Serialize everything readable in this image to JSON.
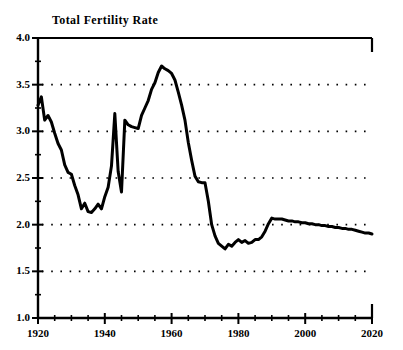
{
  "chart_data": {
    "type": "line",
    "title": "Total Fertility Rate",
    "xlabel": "",
    "ylabel": "",
    "xlim": [
      1920,
      2020
    ],
    "ylim": [
      1.0,
      4.0
    ],
    "grid": "horizontal-dotted",
    "legend": "none",
    "y_ticks": [
      "1.0",
      "1.5",
      "2.0",
      "2.5",
      "3.0",
      "3.5",
      "4.0"
    ],
    "y_tick_values": [
      1.0,
      1.5,
      2.0,
      2.5,
      3.0,
      3.5,
      4.0
    ],
    "y_minor_step": 0.25,
    "x_ticks": [
      "1920",
      "1940",
      "1960",
      "1980",
      "2000",
      "2020"
    ],
    "x_tick_values": [
      1920,
      1940,
      1960,
      1980,
      2000,
      2020
    ],
    "x_minor_step": 5,
    "line_color": "#000000",
    "line_width": 3,
    "series": [
      {
        "name": "Total Fertility Rate",
        "x": [
          1920,
          1921,
          1922,
          1923,
          1924,
          1925,
          1926,
          1927,
          1928,
          1929,
          1930,
          1931,
          1932,
          1933,
          1934,
          1935,
          1936,
          1937,
          1938,
          1939,
          1940,
          1941,
          1942,
          1943,
          1944,
          1945,
          1946,
          1947,
          1948,
          1949,
          1950,
          1951,
          1952,
          1953,
          1954,
          1955,
          1956,
          1957,
          1958,
          1959,
          1960,
          1961,
          1962,
          1963,
          1964,
          1965,
          1966,
          1967,
          1968,
          1969,
          1970,
          1971,
          1972,
          1973,
          1974,
          1975,
          1976,
          1977,
          1978,
          1979,
          1980,
          1981,
          1982,
          1983,
          1984,
          1985,
          1986,
          1987,
          1988,
          1989,
          1990,
          1991,
          1992,
          1993,
          1994,
          1995,
          1996,
          1997,
          1998,
          1999,
          2000,
          2001,
          2002,
          2003,
          2004,
          2005,
          2006,
          2007,
          2008,
          2009,
          2010,
          2011,
          2012,
          2013,
          2014,
          2015,
          2016,
          2017,
          2018,
          2019,
          2020
        ],
        "values": [
          3.28,
          3.37,
          3.12,
          3.17,
          3.1,
          2.98,
          2.87,
          2.8,
          2.64,
          2.56,
          2.54,
          2.42,
          2.32,
          2.17,
          2.23,
          2.14,
          2.13,
          2.17,
          2.22,
          2.17,
          2.3,
          2.4,
          2.63,
          3.19,
          2.57,
          2.35,
          3.12,
          3.07,
          3.05,
          3.04,
          3.03,
          3.17,
          3.25,
          3.33,
          3.45,
          3.52,
          3.63,
          3.7,
          3.67,
          3.65,
          3.62,
          3.55,
          3.42,
          3.28,
          3.12,
          2.88,
          2.69,
          2.52,
          2.46,
          2.45,
          2.45,
          2.25,
          2.0,
          1.88,
          1.8,
          1.77,
          1.74,
          1.79,
          1.77,
          1.81,
          1.84,
          1.81,
          1.83,
          1.8,
          1.81,
          1.84,
          1.84,
          1.87,
          1.93,
          2.01,
          2.07,
          2.06,
          2.06,
          2.06,
          2.05,
          2.04,
          2.04,
          2.03,
          2.03,
          2.02,
          2.02,
          2.01,
          2.01,
          2.0,
          2.0,
          1.99,
          1.99,
          1.98,
          1.98,
          1.97,
          1.97,
          1.96,
          1.96,
          1.95,
          1.95,
          1.94,
          1.93,
          1.92,
          1.91,
          1.91,
          1.9
        ]
      }
    ]
  },
  "axes": {
    "y_labels": [
      "4.0",
      "3.5",
      "3.0",
      "2.5",
      "2.0",
      "1.5",
      "1.0"
    ],
    "x_labels": [
      "1920",
      "1940",
      "1960",
      "1980",
      "2000",
      "2020"
    ]
  }
}
